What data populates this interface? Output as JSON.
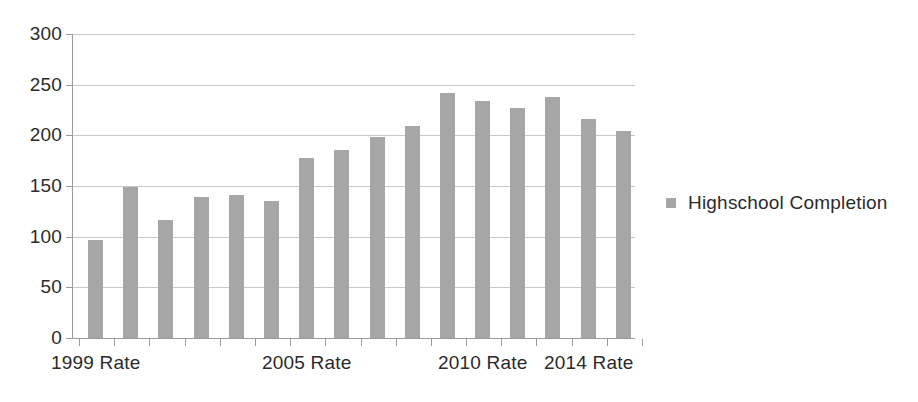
{
  "chart_data": {
    "type": "bar",
    "title": "",
    "xlabel": "",
    "ylabel": "",
    "ylim": [
      0,
      300
    ],
    "y_ticks": [
      0,
      50,
      100,
      150,
      200,
      250,
      300
    ],
    "grid": true,
    "legend_position": "right",
    "series": [
      {
        "name": "Highschool Completion",
        "color": "#a6a6a6",
        "values": [
          97,
          149,
          116,
          139,
          141,
          135,
          178,
          186,
          198,
          209,
          242,
          234,
          227,
          238,
          216,
          204
        ]
      }
    ],
    "categories": [
      "1999 Rate",
      "",
      "",
      "",
      "",
      "",
      "2005 Rate",
      "",
      "",
      "",
      "",
      "2010 Rate",
      "",
      "",
      "2014 Rate",
      ""
    ],
    "x_tick_labels": [
      "1999 Rate",
      "2005 Rate",
      "2010 Rate",
      "2014 Rate"
    ],
    "x_tick_label_bar_index": [
      0,
      6,
      11,
      14
    ]
  },
  "axes": {
    "y_tick_labels": [
      "300",
      "250",
      "200",
      "150",
      "100",
      "50",
      "0"
    ],
    "y_tick_values": [
      300,
      250,
      200,
      150,
      100,
      50,
      0
    ]
  },
  "legend": {
    "entries": [
      {
        "label": "Highschool Completion",
        "color": "#a6a6a6",
        "marker": "square-marker"
      }
    ]
  },
  "colors": {
    "bar": "#a6a6a6",
    "gridline": "#c9c9c9",
    "axis": "#9b9b9b",
    "text": "#2b2b2b",
    "background": "#ffffff"
  }
}
